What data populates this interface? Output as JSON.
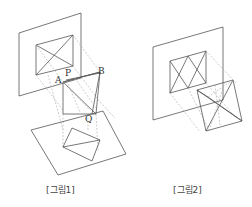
{
  "figures": [
    {
      "caption": "[그림1]",
      "point_labels": {
        "A": "A",
        "P": "P",
        "B": "B",
        "Q": "Q"
      }
    },
    {
      "caption": "[그림2]"
    }
  ]
}
